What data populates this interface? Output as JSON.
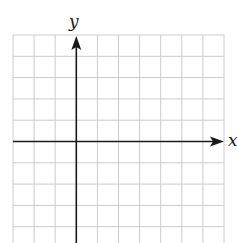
{
  "graph": {
    "axis_labels": {
      "x": "x",
      "y": "y"
    },
    "grid": {
      "columns": 10,
      "rows_visible": 10,
      "line_color": "#cccccc",
      "axis_color": "#1a1a1a"
    },
    "origin": {
      "column_index": 3,
      "row_index": 5
    }
  }
}
